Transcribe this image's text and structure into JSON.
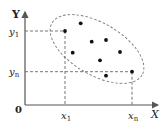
{
  "diagram": {
    "type": "scatter-with-ellipse",
    "axes": {
      "x_label": "X",
      "y_label": "Y",
      "origin_label": "0"
    },
    "ticks": {
      "x": [
        {
          "main": "x",
          "sub": "1"
        },
        {
          "main": "x",
          "sub": "n"
        }
      ],
      "y": [
        {
          "main": "y",
          "sub": "1"
        },
        {
          "main": "y",
          "sub": "n"
        }
      ]
    },
    "points": [
      {
        "x": 65,
        "y": 31,
        "role": "first"
      },
      {
        "x": 80.7,
        "y": 23.3
      },
      {
        "x": 91.7,
        "y": 41.7
      },
      {
        "x": 106,
        "y": 40
      },
      {
        "x": 72.7,
        "y": 52.7
      },
      {
        "x": 120,
        "y": 52
      },
      {
        "x": 100,
        "y": 60.3
      },
      {
        "x": 106,
        "y": 75.7
      },
      {
        "x": 132,
        "y": 71.7,
        "role": "last"
      }
    ],
    "ellipse": {
      "cx": 97,
      "cy": 49,
      "rx": 52,
      "ry": 26,
      "rotate": 30
    },
    "colors": {
      "line": "#555555",
      "dashed": "#666666",
      "point": "#111111"
    }
  }
}
